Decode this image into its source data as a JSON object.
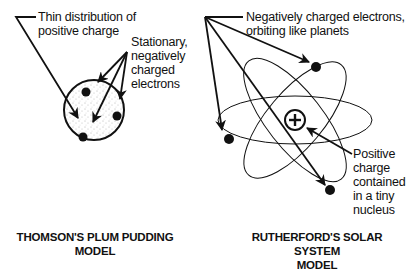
{
  "thomson": {
    "title_line1": "THOMSON'S PLUM PUDDING",
    "title_line2": "MODEL",
    "label_positive": {
      "line1": "Thin distribution of",
      "line2": "positive charge"
    },
    "label_electrons": {
      "line1": "Stationary,",
      "line2": "negatively",
      "line3": "charged",
      "line4": "electrons"
    }
  },
  "rutherford": {
    "title_line1": "RUTHERFORD'S SOLAR SYSTEM",
    "title_line2": "MODEL",
    "label_electrons": {
      "line1": "Negatively charged electrons,",
      "line2": "orbiting like planets"
    },
    "label_nucleus": {
      "line1": "Positive",
      "line2": "charge",
      "line3": "contained",
      "line4": "in a tiny",
      "line5": "nucleus"
    },
    "nucleus_symbol": "+"
  },
  "colors": {
    "ink": "#111111",
    "background": "#ffffff",
    "stipple": "#666666"
  }
}
